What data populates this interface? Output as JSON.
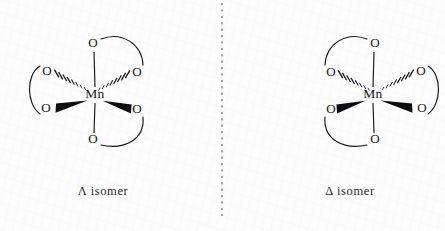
{
  "figure": {
    "background_color": "#fdfdfd",
    "ink_color": "#17171a",
    "mirror_plane": {
      "label": "mirror-plane",
      "x": 222,
      "y_top": 3,
      "y_bottom": 216,
      "color": "#6e6e74",
      "style": "dashed"
    }
  },
  "structures": [
    {
      "id": "lambda",
      "caption": "Λ  isomer",
      "chirality_symbol": "Λ",
      "chirality_name": "Lambda",
      "center_atom": "Mn",
      "center_x": 95,
      "center_y": 95,
      "ligand_count": 6,
      "chelate_ring_count": 3,
      "donor_atoms": [
        {
          "name": "O-top",
          "symbol": "O",
          "x": 93,
          "y": 44,
          "bond_type": "plain"
        },
        {
          "name": "O-bottom",
          "symbol": "O",
          "x": 93,
          "y": 140,
          "bond_type": "plain"
        },
        {
          "name": "O-upper-left",
          "symbol": "O",
          "x": 47,
          "y": 72,
          "bond_type": "hashed"
        },
        {
          "name": "O-upper-right",
          "symbol": "O",
          "x": 137,
          "y": 73,
          "bond_type": "hashed"
        },
        {
          "name": "O-lower-left",
          "symbol": "O",
          "x": 46,
          "y": 109,
          "bond_type": "wedge"
        },
        {
          "name": "O-lower-right",
          "symbol": "O",
          "x": 137,
          "y": 110,
          "bond_type": "wedge"
        }
      ],
      "chelate_arcs": [
        {
          "name": "arc-top-right",
          "from": "O-top",
          "to": "O-upper-right",
          "bulge": "outward-up-right"
        },
        {
          "name": "arc-left",
          "from": "O-upper-left",
          "to": "O-lower-left",
          "bulge": "outward-left"
        },
        {
          "name": "arc-bottom-right",
          "from": "O-lower-right",
          "to": "O-bottom",
          "bulge": "outward-down-right"
        }
      ]
    },
    {
      "id": "delta",
      "caption": "Δ  isomer",
      "chirality_symbol": "Δ",
      "chirality_name": "Delta",
      "center_atom": "Mn",
      "center_x": 373,
      "center_y": 95,
      "ligand_count": 6,
      "chelate_ring_count": 3,
      "donor_atoms": [
        {
          "name": "O-top",
          "symbol": "O",
          "x": 375,
          "y": 44,
          "bond_type": "plain"
        },
        {
          "name": "O-bottom",
          "symbol": "O",
          "x": 375,
          "y": 140,
          "bond_type": "plain"
        },
        {
          "name": "O-upper-left",
          "symbol": "O",
          "x": 331,
          "y": 73,
          "bond_type": "hashed"
        },
        {
          "name": "O-upper-right",
          "symbol": "O",
          "x": 421,
          "y": 72,
          "bond_type": "hashed"
        },
        {
          "name": "O-lower-left",
          "symbol": "O",
          "x": 331,
          "y": 110,
          "bond_type": "wedge"
        },
        {
          "name": "O-lower-right",
          "symbol": "O",
          "x": 422,
          "y": 109,
          "bond_type": "wedge"
        }
      ],
      "chelate_arcs": [
        {
          "name": "arc-top-left",
          "from": "O-top",
          "to": "O-upper-left",
          "bulge": "outward-up-left"
        },
        {
          "name": "arc-right",
          "from": "O-upper-right",
          "to": "O-lower-right",
          "bulge": "outward-right"
        },
        {
          "name": "arc-bottom-left",
          "from": "O-lower-left",
          "to": "O-bottom",
          "bulge": "outward-down-left"
        }
      ]
    }
  ],
  "captions": {
    "left": "Λ  isomer",
    "right": "Δ  isomer",
    "left_y": 192,
    "right_y": 192
  }
}
